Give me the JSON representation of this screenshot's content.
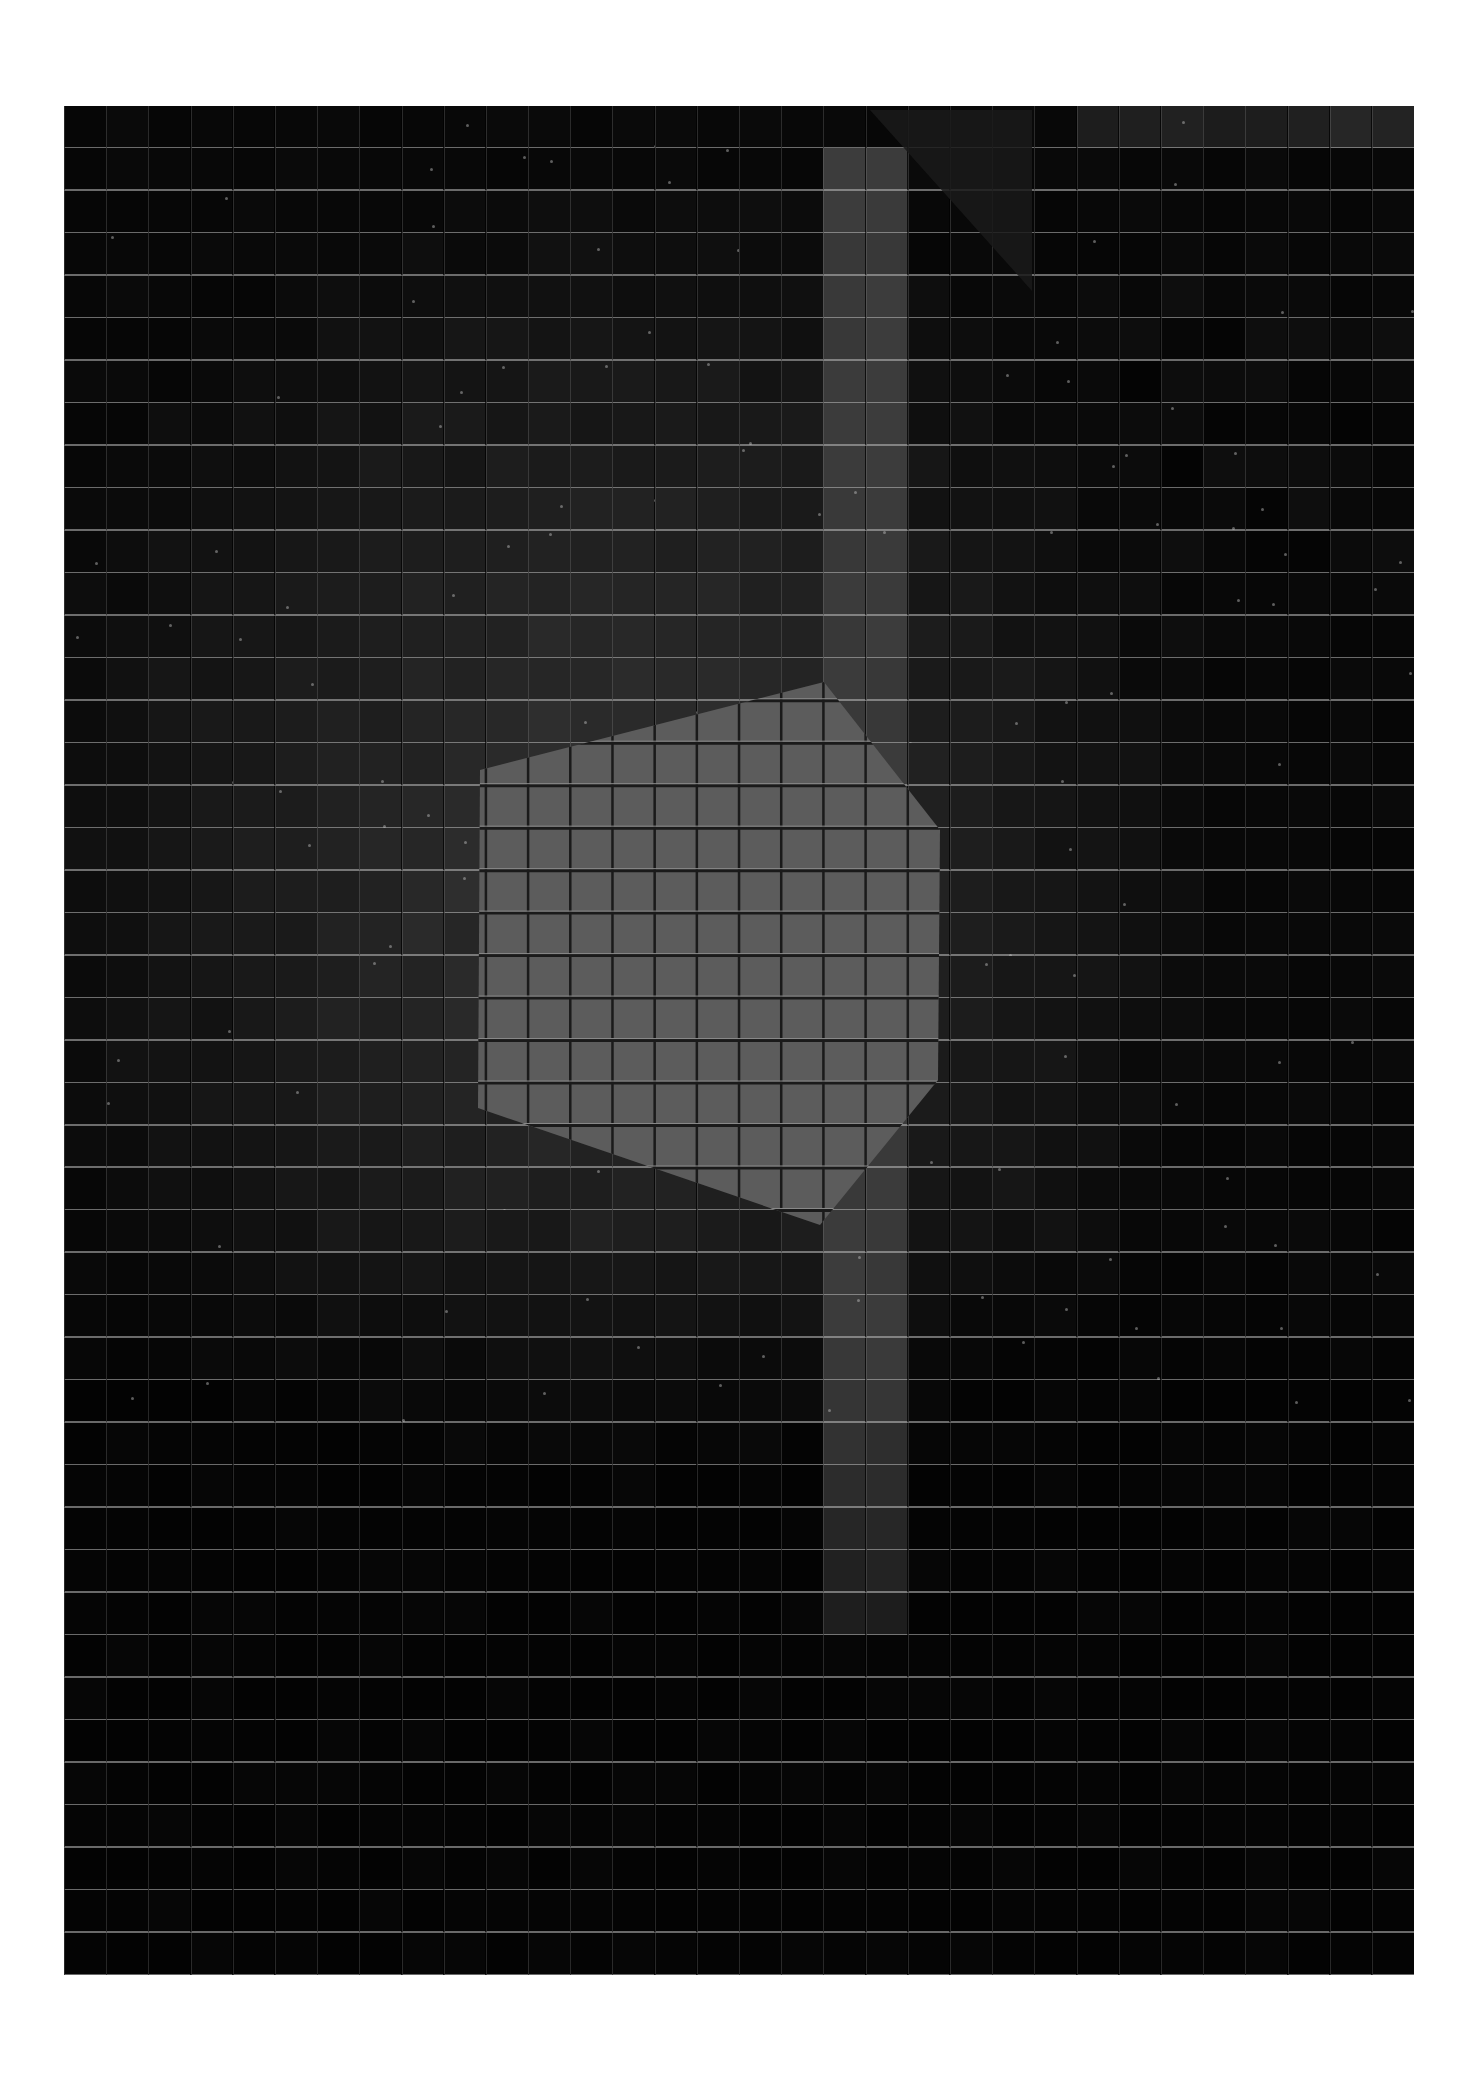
{
  "artwork": {
    "frame": {
      "left": 64,
      "top": 106,
      "width": 1350,
      "height": 1869
    },
    "grid": {
      "columns": 32,
      "rows": 44,
      "cell_width": 42.19,
      "cell_height": 42.48
    },
    "colors": {
      "background": "#050505",
      "darkest_tile": "#060606",
      "mid_tile": "#2a2a2a",
      "glow_tile": "#353535",
      "band_tile": "#3c3c3c",
      "polygon_fill": "#5c5c5c",
      "fold_triangle": "#1a1a1a",
      "grid_highlight": "#bebebe"
    },
    "regions": {
      "glow_center": {
        "x": 560,
        "y": 760,
        "rx": 620,
        "ry": 720
      },
      "vertical_band": {
        "x": 758,
        "width": 84,
        "top": 60,
        "bottom": 1540
      },
      "dark_right_block": {
        "x": 1016,
        "y": 170,
        "width": 334,
        "height": 300
      },
      "top_right_light_row": {
        "x": 758,
        "y": 0,
        "width": 592,
        "height": 42
      },
      "bottom_dark_start_y": 1100,
      "fold_triangle_points": [
        [
          806,
          4
        ],
        [
          968,
          185
        ],
        [
          968,
          4
        ]
      ]
    },
    "polygon": {
      "label": "bright-hexagon",
      "points": [
        [
          416,
          664
        ],
        [
          760,
          576
        ],
        [
          876,
          724
        ],
        [
          874,
          974
        ],
        [
          756,
          1119
        ],
        [
          414,
          1002
        ]
      ]
    }
  }
}
